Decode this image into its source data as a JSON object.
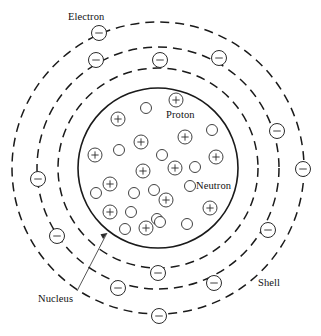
{
  "diagram": {
    "labels": {
      "electron": "Electron",
      "proton": "Proton",
      "neutron": "Neutron",
      "nucleus": "Nucleus",
      "shell": "Shell"
    },
    "colors": {
      "background": "#ffffff",
      "stroke": "#1a1a1a",
      "particle_stroke": "#2b2b2b",
      "text": "#111111"
    },
    "center": {
      "x": 158,
      "y": 168
    },
    "nucleus": {
      "radius": 80,
      "line_style": "solid",
      "leader_line": {
        "x1": 107,
        "y1": 233,
        "x2": 77,
        "y2": 291
      }
    },
    "shells": [
      {
        "index": 1,
        "radius": 100,
        "line_style": "dashed",
        "electron_count": 5
      },
      {
        "index": 2,
        "radius": 121,
        "line_style": "dashed",
        "electron_count": 5
      },
      {
        "index": 3,
        "radius": 146,
        "line_style": "dashed",
        "electron_count": 4
      }
    ],
    "electrons": [
      {
        "cx": 99,
        "cy": 33,
        "r": 7.5,
        "shell": 3
      },
      {
        "cx": 219,
        "cy": 58,
        "r": 7.5,
        "shell": 3
      },
      {
        "cx": 303,
        "cy": 169,
        "r": 7.5,
        "shell": 3
      },
      {
        "cx": 159,
        "cy": 316,
        "r": 7.5,
        "shell": 3
      },
      {
        "cx": 96,
        "cy": 60,
        "r": 7.5,
        "shell": 2
      },
      {
        "cx": 277,
        "cy": 131,
        "r": 7.5,
        "shell": 2
      },
      {
        "cx": 268,
        "cy": 230,
        "r": 7.5,
        "shell": 2
      },
      {
        "cx": 118,
        "cy": 288,
        "r": 7.5,
        "shell": 2
      },
      {
        "cx": 38,
        "cy": 179,
        "r": 7.5,
        "shell": 2
      },
      {
        "cx": 160,
        "cy": 60,
        "r": 7.5,
        "shell": 1
      },
      {
        "cx": 57,
        "cy": 236,
        "r": 7.5,
        "shell": 1
      },
      {
        "cx": 214,
        "cy": 283,
        "r": 7.5,
        "shell": 1
      },
      {
        "cx": 158,
        "cy": 273,
        "r": 7.5,
        "shell": 1
      }
    ],
    "protons": [
      {
        "cx": 176,
        "cy": 100,
        "r": 7.0
      },
      {
        "cx": 118,
        "cy": 119,
        "r": 7.0
      },
      {
        "cx": 141,
        "cy": 142,
        "r": 7.0
      },
      {
        "cx": 185,
        "cy": 137,
        "r": 7.0
      },
      {
        "cx": 95,
        "cy": 155,
        "r": 7.0
      },
      {
        "cx": 216,
        "cy": 157,
        "r": 7.0
      },
      {
        "cx": 143,
        "cy": 171,
        "r": 7.0
      },
      {
        "cx": 175,
        "cy": 168,
        "r": 7.0
      },
      {
        "cx": 110,
        "cy": 184,
        "r": 7.0
      },
      {
        "cx": 166,
        "cy": 200,
        "r": 7.0
      },
      {
        "cx": 210,
        "cy": 208,
        "r": 7.0
      },
      {
        "cx": 110,
        "cy": 212,
        "r": 7.0
      },
      {
        "cx": 146,
        "cy": 228,
        "r": 7.0
      }
    ],
    "neutrons": [
      {
        "cx": 146,
        "cy": 108,
        "r": 5.5
      },
      {
        "cx": 212,
        "cy": 130,
        "r": 5.5
      },
      {
        "cx": 119,
        "cy": 150,
        "r": 5.5
      },
      {
        "cx": 162,
        "cy": 155,
        "r": 5.5
      },
      {
        "cx": 195,
        "cy": 167,
        "r": 5.5
      },
      {
        "cx": 154,
        "cy": 190,
        "r": 5.5
      },
      {
        "cx": 190,
        "cy": 186,
        "r": 5.5
      },
      {
        "cx": 96,
        "cy": 193,
        "r": 5.5
      },
      {
        "cx": 134,
        "cy": 193,
        "r": 5.5
      },
      {
        "cx": 131,
        "cy": 212,
        "r": 5.5
      },
      {
        "cx": 157,
        "cy": 219,
        "r": 5.5
      },
      {
        "cx": 187,
        "cy": 224,
        "r": 5.5
      },
      {
        "cx": 125,
        "cy": 229,
        "r": 5.5
      },
      {
        "cx": 160,
        "cy": 222,
        "r": 5.5
      }
    ]
  }
}
